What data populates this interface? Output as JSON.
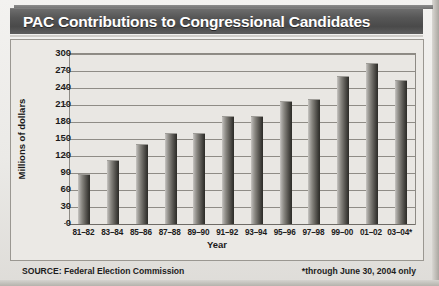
{
  "title": "PAC Contributions to Congressional Candidates",
  "footer": {
    "source": "SOURCE: Federal Election Commission",
    "note": "*through June 30, 2004 only"
  },
  "chart_data": {
    "type": "bar",
    "title": "PAC Contributions to Congressional Candidates",
    "subtitle": "",
    "xlabel": "Year",
    "ylabel": "Millions of dollars",
    "categories": [
      "81–82",
      "83–84",
      "85–86",
      "87–88",
      "89–90",
      "91–92",
      "93–94",
      "95–96",
      "97–98",
      "99–00",
      "01–02",
      "03–04*"
    ],
    "values": [
      87,
      112,
      140,
      159,
      158,
      188,
      188,
      215,
      218,
      260,
      282,
      253
    ],
    "ylim": [
      0,
      300
    ],
    "ytick_values": [
      0,
      30,
      60,
      90,
      120,
      150,
      180,
      210,
      240,
      270,
      300
    ],
    "ytick_labels": [
      "0",
      "30",
      "60",
      "90",
      "120",
      "150",
      "180",
      "210",
      "240",
      "270",
      "300"
    ],
    "grid": true,
    "legend": false,
    "legend_position": "none",
    "bar_color": "#5e5c57",
    "plot_background": "#e9e7e3",
    "annotations": [
      "SOURCE: Federal Election Commission",
      "*through June 30, 2004 only"
    ]
  }
}
